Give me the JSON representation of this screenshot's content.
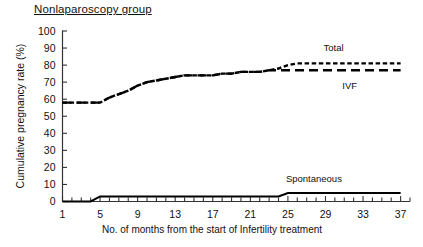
{
  "chart_data": {
    "type": "line",
    "title": "Nonlaparoscopy group",
    "xlabel": "No. of months from the start of Infertility treatment",
    "ylabel": "Cumulative pregnancy rate (%)",
    "xlim": [
      1,
      38
    ],
    "ylim": [
      0,
      100
    ],
    "grid": false,
    "legend_position": "inline-right",
    "ytick_labels": [
      "0",
      "10",
      "20",
      "30",
      "40",
      "50",
      "60",
      "70",
      "80",
      "90",
      "100"
    ],
    "ytick_values": [
      0,
      10,
      20,
      30,
      40,
      50,
      60,
      70,
      80,
      90,
      100
    ],
    "xtick_labels": [
      "1",
      "5",
      "9",
      "13",
      "17",
      "21",
      "25",
      "29",
      "33",
      "37"
    ],
    "xtick_values": [
      1,
      5,
      9,
      13,
      17,
      21,
      25,
      29,
      33,
      37
    ],
    "xminor_step": 1,
    "line_color": "#000000",
    "x": [
      1,
      2,
      3,
      4,
      5,
      6,
      7,
      8,
      9,
      10,
      11,
      12,
      13,
      14,
      15,
      16,
      17,
      18,
      19,
      20,
      21,
      22,
      23,
      24,
      25,
      26,
      27,
      28,
      29,
      30,
      31,
      32,
      33,
      34,
      35,
      36,
      37
    ],
    "series": [
      {
        "name": "Total",
        "style": "short-dash",
        "label_x": 29,
        "label_y": 90,
        "values": [
          58,
          58,
          58,
          58,
          58,
          61,
          63,
          65,
          68,
          70,
          71,
          72,
          73,
          74,
          74,
          74,
          74,
          75,
          75,
          76,
          76,
          76,
          77,
          78,
          80,
          81,
          81,
          81,
          81,
          81,
          81,
          81,
          81,
          81,
          81,
          81,
          81
        ]
      },
      {
        "name": "IVF",
        "style": "long-dash",
        "label_x": 31,
        "label_y": 68,
        "values": [
          58,
          58,
          58,
          58,
          58,
          61,
          63,
          65,
          68,
          70,
          71,
          72,
          73,
          74,
          74,
          74,
          74,
          75,
          75,
          76,
          76,
          76,
          77,
          77,
          77,
          77,
          77,
          77,
          77,
          77,
          77,
          77,
          77,
          77,
          77,
          77,
          77
        ]
      },
      {
        "name": "Spontaneous",
        "style": "solid",
        "label_x": 25,
        "label_y": 13,
        "values": [
          0,
          0,
          0,
          0,
          3,
          3,
          3,
          3,
          3,
          3,
          3,
          3,
          3,
          3,
          3,
          3,
          3,
          3,
          3,
          3,
          3,
          3,
          3,
          3,
          5,
          5,
          5,
          5,
          5,
          5,
          5,
          5,
          5,
          5,
          5,
          5,
          5
        ]
      }
    ]
  }
}
